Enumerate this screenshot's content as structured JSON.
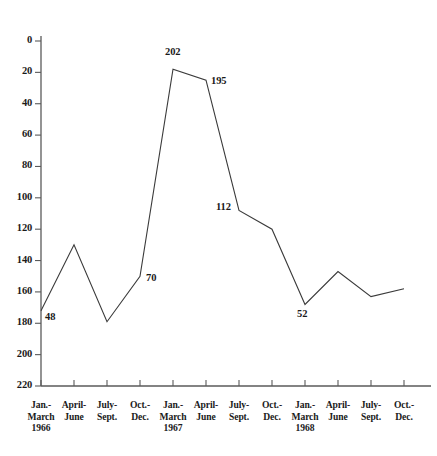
{
  "chart_data": {
    "type": "line",
    "title": "",
    "xlabel": "",
    "ylabel": "",
    "ylim": [
      0,
      230
    ],
    "grid": false,
    "legend": "none",
    "y_ticks": [
      0,
      20,
      40,
      60,
      80,
      100,
      120,
      140,
      160,
      180,
      200,
      220
    ],
    "categories": [
      "Jan.-March 1966",
      "April-June",
      "July-Sept.",
      "Oct.-Dec.",
      "Jan.-March 1967",
      "April-June",
      "July-Sept.",
      "Oct.-Dec.",
      "Jan.-March 1968",
      "April-June",
      "July-Sept.",
      "Oct.-Dec."
    ],
    "values": [
      48,
      90,
      41,
      70,
      202,
      195,
      112,
      100,
      52,
      73,
      57,
      62
    ],
    "point_labels": [
      {
        "index": 0,
        "text": "48"
      },
      {
        "index": 3,
        "text": "70"
      },
      {
        "index": 4,
        "text": "202"
      },
      {
        "index": 5,
        "text": "195"
      },
      {
        "index": 6,
        "text": "112"
      },
      {
        "index": 8,
        "text": "52"
      }
    ],
    "line_color": "#3a3a3a",
    "axis_color": "#5a5a5a"
  },
  "axis": {
    "y_tick_labels": [
      "220",
      "200",
      "180",
      "160",
      "140",
      "120",
      "100",
      "80",
      "60",
      "40",
      "20",
      "0"
    ],
    "x_tick_labels": [
      {
        "line1": "Jan.-",
        "line2": "March",
        "line3": "1966"
      },
      {
        "line1": "April-",
        "line2": "June",
        "line3": ""
      },
      {
        "line1": "July-",
        "line2": "Sept.",
        "line3": ""
      },
      {
        "line1": "Oct.-",
        "line2": "Dec.",
        "line3": ""
      },
      {
        "line1": "Jan.-",
        "line2": "March",
        "line3": "1967"
      },
      {
        "line1": "April-",
        "line2": "June",
        "line3": ""
      },
      {
        "line1": "July-",
        "line2": "Sept.",
        "line3": ""
      },
      {
        "line1": "Oct.-",
        "line2": "Dec.",
        "line3": ""
      },
      {
        "line1": "Jan.-",
        "line2": "March",
        "line3": "1968"
      },
      {
        "line1": "April-",
        "line2": "June",
        "line3": ""
      },
      {
        "line1": "July-",
        "line2": "Sept.",
        "line3": ""
      },
      {
        "line1": "Oct.-",
        "line2": "Dec.",
        "line3": ""
      }
    ]
  }
}
